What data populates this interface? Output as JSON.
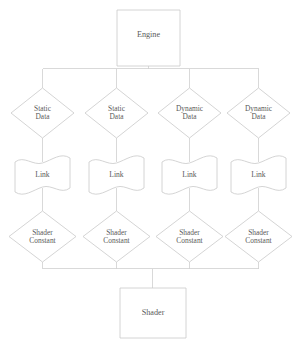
{
  "diagram": {
    "style": {
      "stroke_color": "#c9c9c9",
      "connector_color": "#cfcfcf",
      "text_color": "#5a5a5a",
      "background_color": "#ffffff"
    },
    "nodes": {
      "engine": {
        "label": "Engine",
        "shape": "rectangle"
      },
      "sources": [
        {
          "label": "Static\nData",
          "shape": "diamond"
        },
        {
          "label": "Static\nData",
          "shape": "diamond"
        },
        {
          "label": "Dynamic\nData",
          "shape": "diamond"
        },
        {
          "label": "Dynamic\nData",
          "shape": "diamond"
        }
      ],
      "links": [
        {
          "label": "Link",
          "shape": "flag"
        },
        {
          "label": "Link",
          "shape": "flag"
        },
        {
          "label": "Link",
          "shape": "flag"
        },
        {
          "label": "Link",
          "shape": "flag"
        }
      ],
      "constants": [
        {
          "label": "Shader\nConstant",
          "shape": "diamond"
        },
        {
          "label": "Shader\nConstant",
          "shape": "diamond"
        },
        {
          "label": "Shader\nConstant",
          "shape": "diamond"
        },
        {
          "label": "Shader\nConstant",
          "shape": "diamond"
        }
      ],
      "shader": {
        "label": "Shader",
        "shape": "rectangle"
      }
    }
  }
}
